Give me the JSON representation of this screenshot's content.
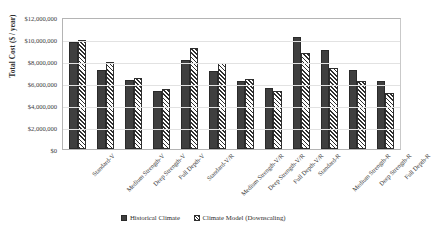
{
  "chart_data": {
    "type": "bar",
    "title": "",
    "xlabel": "",
    "ylabel": "Total Cost ($ / year)",
    "ylim": [
      0,
      12000000
    ],
    "ytick_labels": [
      "$12,000,000",
      "$10,000,000",
      "$8,000,000",
      "$6,000,000",
      "$4,000,000",
      "$2,000,000",
      "$0"
    ],
    "ytick_values": [
      12000000,
      10000000,
      8000000,
      6000000,
      4000000,
      2000000,
      0
    ],
    "grid": true,
    "legend_position": "bottom",
    "categories": [
      "Standard-V",
      "Medium Strength-V",
      "Deep Strength-V",
      "Full Depth-V",
      "Standard-V/R",
      "Medium Strength-V/R",
      "Deep Strength-V/R",
      "Full Depth-V/R",
      "Standard-R",
      "Medium Strength-R",
      "Deep Strength-R",
      "Full Depth-R"
    ],
    "series": [
      {
        "name": "Historical Climate",
        "fill": "solid-dark",
        "color": "#3f3f3f",
        "values": [
          9700000,
          7200000,
          6250000,
          5300000,
          8100000,
          7100000,
          6150000,
          5550000,
          10150000,
          9000000,
          7200000,
          6200000
        ]
      },
      {
        "name": "Climate Model (Downscaling)",
        "fill": "diagonal-hatch",
        "color": "#2f2f2f",
        "values": [
          9900000,
          7900000,
          6500000,
          5450000,
          9200000,
          7800000,
          6400000,
          5300000,
          8750000,
          7350000,
          6150000,
          5050000
        ]
      }
    ]
  },
  "legend": {
    "items": [
      {
        "label": "Historical Climate"
      },
      {
        "label": "Climate Model (Downscaling)"
      }
    ]
  }
}
